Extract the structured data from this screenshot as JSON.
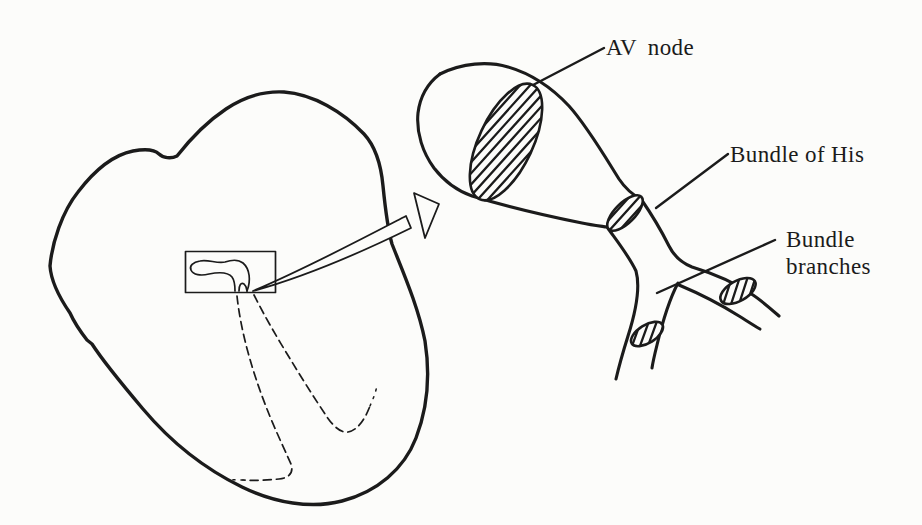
{
  "figure": {
    "colors": {
      "paper": "#fcfcfa",
      "ink": "#1b1b1b"
    },
    "labels": {
      "av_node": "AV node",
      "bundle_of_his": "Bundle of His",
      "bundle_branches": {
        "line1": "Bundle",
        "line2": "branches"
      }
    }
  }
}
